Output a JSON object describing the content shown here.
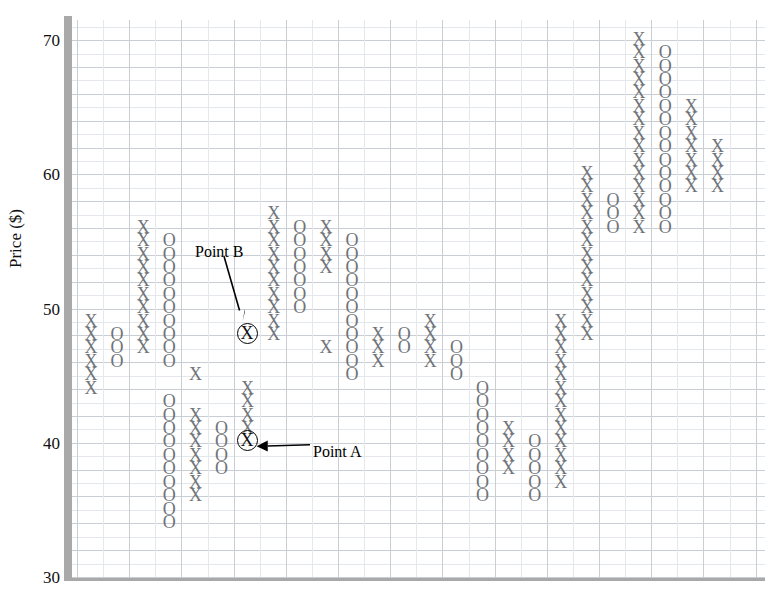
{
  "chart_data": {
    "type": "scatter",
    "chart_kind": "point-and-figure",
    "title": "",
    "xlabel": "",
    "ylabel": "Price ($)",
    "ylim": [
      30,
      71
    ],
    "y_ticks": [
      30,
      40,
      50,
      60,
      70
    ],
    "y_tick_labels": [
      "30",
      "40",
      "50",
      "60",
      "70"
    ],
    "x_ticks": [],
    "x_tick_labels": [],
    "grid": true,
    "box_size": 1,
    "mark_symbols": [
      "X",
      "O"
    ],
    "series": [
      {
        "name": "X",
        "symbol": "X",
        "description": "rising column marks"
      },
      {
        "name": "O",
        "symbol": "O",
        "description": "falling column marks"
      }
    ],
    "columns": [
      {
        "col": 1,
        "symbol": "X",
        "prices": [
          50,
          49,
          48,
          47,
          46,
          45
        ]
      },
      {
        "col": 2,
        "symbol": "O",
        "prices": [
          49,
          48,
          47
        ]
      },
      {
        "col": 3,
        "symbol": "X",
        "prices": [
          57,
          56,
          55,
          54,
          53,
          52,
          51,
          50,
          49,
          48
        ]
      },
      {
        "col": 4,
        "symbol": "O",
        "prices": [
          56,
          55,
          54,
          53,
          52,
          51,
          50,
          49,
          48,
          47,
          44,
          43,
          42,
          41,
          40,
          39,
          38,
          37,
          36,
          35
        ]
      },
      {
        "col": 5,
        "symbol": "X",
        "prices": [
          46,
          43,
          42,
          41,
          40,
          39,
          38,
          37
        ]
      },
      {
        "col": 6,
        "symbol": "O",
        "prices": [
          42,
          41,
          40,
          39
        ]
      },
      {
        "col": 7,
        "symbol": "X",
        "prices": [
          49,
          45,
          44,
          43,
          42,
          41
        ]
      },
      {
        "col": 8,
        "symbol": "X",
        "prices": [
          58,
          57,
          56,
          55,
          54,
          53,
          52,
          51,
          50,
          49
        ]
      },
      {
        "col": 9,
        "symbol": "O",
        "prices": [
          57,
          56,
          55,
          54,
          53,
          52,
          51
        ]
      },
      {
        "col": 10,
        "symbol": "X",
        "prices": [
          57,
          56,
          55,
          54,
          48
        ]
      },
      {
        "col": 11,
        "symbol": "O",
        "prices": [
          56,
          55,
          54,
          53,
          52,
          51,
          50,
          49,
          48,
          47,
          46
        ]
      },
      {
        "col": 12,
        "symbol": "X",
        "prices": [
          49,
          48,
          47
        ]
      },
      {
        "col": 13,
        "symbol": "O",
        "prices": [
          49,
          48
        ]
      },
      {
        "col": 14,
        "symbol": "X",
        "prices": [
          50,
          49,
          48,
          47
        ]
      },
      {
        "col": 15,
        "symbol": "O",
        "prices": [
          48,
          47,
          46
        ]
      },
      {
        "col": 16,
        "symbol": "O",
        "prices": [
          45,
          44,
          43,
          42,
          41,
          40,
          39,
          38,
          37
        ]
      },
      {
        "col": 17,
        "symbol": "X",
        "prices": [
          42,
          41,
          40,
          39
        ]
      },
      {
        "col": 18,
        "symbol": "O",
        "prices": [
          41,
          40,
          39,
          38,
          37
        ]
      },
      {
        "col": 19,
        "symbol": "X",
        "prices": [
          50,
          49,
          48,
          47,
          46,
          45,
          44,
          43,
          42,
          41,
          40,
          39,
          38
        ]
      },
      {
        "col": 20,
        "symbol": "X",
        "prices": [
          61,
          60,
          59,
          58,
          57,
          56,
          55,
          54,
          53,
          52,
          51,
          50,
          49
        ]
      },
      {
        "col": 21,
        "symbol": "O",
        "prices": [
          59,
          58,
          57
        ]
      },
      {
        "col": 22,
        "symbol": "X",
        "prices": [
          71,
          70,
          69,
          68,
          67,
          66,
          65,
          64,
          63,
          62,
          61,
          60,
          59,
          58,
          57
        ]
      },
      {
        "col": 23,
        "symbol": "O",
        "prices": [
          70,
          69,
          68,
          67,
          66,
          65,
          64,
          63,
          62,
          61,
          60,
          59,
          58,
          57
        ]
      },
      {
        "col": 24,
        "symbol": "X",
        "prices": [
          66,
          65,
          64,
          63,
          62,
          61,
          60
        ]
      },
      {
        "col": 25,
        "symbol": "X",
        "prices": [
          63,
          62,
          61,
          60
        ]
      }
    ],
    "highlighted_points": [
      {
        "id": "point-b",
        "label": "Point B",
        "symbol": "X",
        "price": 49,
        "col": 7
      },
      {
        "id": "point-a",
        "label": "Point A",
        "symbol": "X",
        "price": 41,
        "col": 7
      }
    ],
    "annotations": [
      {
        "id": "point-b",
        "text": "Point B",
        "points_to": "Point B circled X at price 49"
      },
      {
        "id": "point-a",
        "text": "Point A",
        "points_to": "Point A circled X at price 41"
      }
    ],
    "colors": {
      "mark": "#6f7479",
      "highlight": "#000000",
      "grid_major": "#c9cdd4",
      "grid_minor": "#e4e7ec",
      "axis": "#a9a9a9",
      "text": "#111111"
    }
  }
}
